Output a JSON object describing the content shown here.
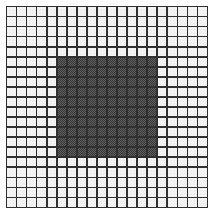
{
  "figure": {
    "background_color": "#ffffff",
    "line_color": "#303030",
    "light_cell_color": "#f4f4f4",
    "dark_cell_color": "#3b3b3b",
    "dark_cell_texture": "checkered-dither"
  },
  "chart_data": {
    "type": "heatmap",
    "title": "",
    "xlabel": "",
    "ylabel": "",
    "columns": 20,
    "rows": 20,
    "legend": [],
    "xticklabels": [],
    "yticklabels": [],
    "grid": true,
    "colorscale": {
      "0": "#f4f4f4",
      "1": "#3b3b3b"
    },
    "filled_region": {
      "col_start": 5,
      "col_end": 14,
      "row_start": 5,
      "row_end": 14,
      "width": 10,
      "height": 10
    },
    "values": [
      [
        0,
        0,
        0,
        0,
        0,
        0,
        0,
        0,
        0,
        0,
        0,
        0,
        0,
        0,
        0,
        0,
        0,
        0,
        0,
        0
      ],
      [
        0,
        0,
        0,
        0,
        0,
        0,
        0,
        0,
        0,
        0,
        0,
        0,
        0,
        0,
        0,
        0,
        0,
        0,
        0,
        0
      ],
      [
        0,
        0,
        0,
        0,
        0,
        0,
        0,
        0,
        0,
        0,
        0,
        0,
        0,
        0,
        0,
        0,
        0,
        0,
        0,
        0
      ],
      [
        0,
        0,
        0,
        0,
        0,
        0,
        0,
        0,
        0,
        0,
        0,
        0,
        0,
        0,
        0,
        0,
        0,
        0,
        0,
        0
      ],
      [
        0,
        0,
        0,
        0,
        0,
        0,
        0,
        0,
        0,
        0,
        0,
        0,
        0,
        0,
        0,
        0,
        0,
        0,
        0,
        0
      ],
      [
        0,
        0,
        0,
        0,
        0,
        1,
        1,
        1,
        1,
        1,
        1,
        1,
        1,
        1,
        1,
        0,
        0,
        0,
        0,
        0
      ],
      [
        0,
        0,
        0,
        0,
        0,
        1,
        1,
        1,
        1,
        1,
        1,
        1,
        1,
        1,
        1,
        0,
        0,
        0,
        0,
        0
      ],
      [
        0,
        0,
        0,
        0,
        0,
        1,
        1,
        1,
        1,
        1,
        1,
        1,
        1,
        1,
        1,
        0,
        0,
        0,
        0,
        0
      ],
      [
        0,
        0,
        0,
        0,
        0,
        1,
        1,
        1,
        1,
        1,
        1,
        1,
        1,
        1,
        1,
        0,
        0,
        0,
        0,
        0
      ],
      [
        0,
        0,
        0,
        0,
        0,
        1,
        1,
        1,
        1,
        1,
        1,
        1,
        1,
        1,
        1,
        0,
        0,
        0,
        0,
        0
      ],
      [
        0,
        0,
        0,
        0,
        0,
        1,
        1,
        1,
        1,
        1,
        1,
        1,
        1,
        1,
        1,
        0,
        0,
        0,
        0,
        0
      ],
      [
        0,
        0,
        0,
        0,
        0,
        1,
        1,
        1,
        1,
        1,
        1,
        1,
        1,
        1,
        1,
        0,
        0,
        0,
        0,
        0
      ],
      [
        0,
        0,
        0,
        0,
        0,
        1,
        1,
        1,
        1,
        1,
        1,
        1,
        1,
        1,
        1,
        0,
        0,
        0,
        0,
        0
      ],
      [
        0,
        0,
        0,
        0,
        0,
        1,
        1,
        1,
        1,
        1,
        1,
        1,
        1,
        1,
        1,
        0,
        0,
        0,
        0,
        0
      ],
      [
        0,
        0,
        0,
        0,
        0,
        1,
        1,
        1,
        1,
        1,
        1,
        1,
        1,
        1,
        1,
        0,
        0,
        0,
        0,
        0
      ],
      [
        0,
        0,
        0,
        0,
        0,
        0,
        0,
        0,
        0,
        0,
        0,
        0,
        0,
        0,
        0,
        0,
        0,
        0,
        0,
        0
      ],
      [
        0,
        0,
        0,
        0,
        0,
        0,
        0,
        0,
        0,
        0,
        0,
        0,
        0,
        0,
        0,
        0,
        0,
        0,
        0,
        0
      ],
      [
        0,
        0,
        0,
        0,
        0,
        0,
        0,
        0,
        0,
        0,
        0,
        0,
        0,
        0,
        0,
        0,
        0,
        0,
        0,
        0
      ],
      [
        0,
        0,
        0,
        0,
        0,
        0,
        0,
        0,
        0,
        0,
        0,
        0,
        0,
        0,
        0,
        0,
        0,
        0,
        0,
        0
      ],
      [
        0,
        0,
        0,
        0,
        0,
        0,
        0,
        0,
        0,
        0,
        0,
        0,
        0,
        0,
        0,
        0,
        0,
        0,
        0,
        0
      ]
    ]
  }
}
